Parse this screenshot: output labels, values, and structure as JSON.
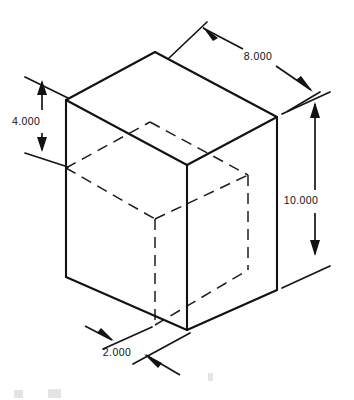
{
  "drawing": {
    "type": "isometric-technical-drawing",
    "subject": "rectangular block with hidden interior cavity",
    "background_color": "#ffffff",
    "line_color": "#121212",
    "dimensions": [
      {
        "id": "depth",
        "label": "8.000",
        "orientation": "diagonal-upper-right",
        "text_x": 258,
        "text_y": 57
      },
      {
        "id": "top-offset",
        "label": "4.000",
        "orientation": "vertical-left",
        "text_x": 12,
        "text_y": 122
      },
      {
        "id": "height",
        "label": "10.000",
        "orientation": "vertical-right",
        "text_x": 301,
        "text_y": 201
      },
      {
        "id": "front-offset",
        "label": "2.000",
        "orientation": "diagonal-lower-left",
        "text_x": 117,
        "text_y": 353
      }
    ]
  }
}
